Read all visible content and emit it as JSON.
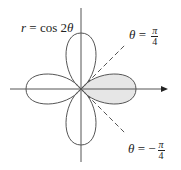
{
  "figure": {
    "curve_label_var": "r",
    "curve_label_eq": " = cos 2",
    "curve_label_theta": "θ",
    "line_upper": {
      "var": "θ",
      "eq": " = ",
      "sign": "",
      "num": "π",
      "den": "4"
    },
    "line_lower": {
      "var": "θ",
      "eq": " = ",
      "sign": "−",
      "num": "π",
      "den": "4"
    }
  },
  "colors": {
    "curve": "#555555",
    "axis": "#555555",
    "shade": "#e6e6e6",
    "dash": "#555555"
  }
}
